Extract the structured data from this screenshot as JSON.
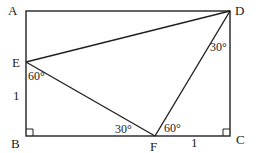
{
  "diagram": {
    "points": {
      "A": {
        "label": "A",
        "x": 26,
        "y": 11
      },
      "D": {
        "label": "D",
        "x": 230,
        "y": 11
      },
      "E": {
        "label": "E",
        "x": 26,
        "y": 62
      },
      "B": {
        "label": "B",
        "x": 26,
        "y": 136
      },
      "F": {
        "label": "F",
        "x": 155,
        "y": 136
      },
      "C": {
        "label": "C",
        "x": 230,
        "y": 136
      }
    },
    "segments": [
      "AD",
      "DC",
      "CB",
      "BA",
      "ED",
      "EF",
      "FD"
    ],
    "angles": {
      "E": "60°",
      "D": "30°",
      "F_left": "30°",
      "F_right": "60°"
    },
    "lengths": {
      "EB": "1",
      "FC": "1"
    },
    "right_angles": [
      "B",
      "C"
    ],
    "line_color": "#222222"
  }
}
